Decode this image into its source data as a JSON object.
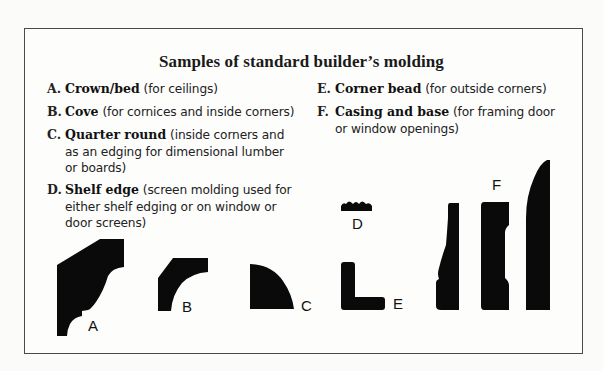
{
  "title": "Samples of standard builder’s molding",
  "items": [
    {
      "letter": "A.",
      "name": "Crown/bed",
      "desc": "(for ceilings)"
    },
    {
      "letter": "B.",
      "name": "Cove",
      "desc": "(for cornices and inside corners)"
    },
    {
      "letter": "C.",
      "name": "Quarter round",
      "desc": "(inside corners and as an edging for dimensional lumber or boards)"
    },
    {
      "letter": "D.",
      "name": "Shelf edge",
      "desc": "(screen molding used for either shelf edging or on window or door screens)"
    },
    {
      "letter": "E.",
      "name": "Corner bead",
      "desc": "(for outside corners)"
    },
    {
      "letter": "F.",
      "name": "Casing and base",
      "desc": "(for framing door or window openings)"
    }
  ],
  "figure_labels": {
    "a": "A",
    "b": "B",
    "c": "C",
    "d": "D",
    "e": "E",
    "f": "F"
  },
  "colors": {
    "shape_fill": "#0a0a0a",
    "frame_border": "#4a4a4a",
    "background": "#fdfdfc"
  }
}
